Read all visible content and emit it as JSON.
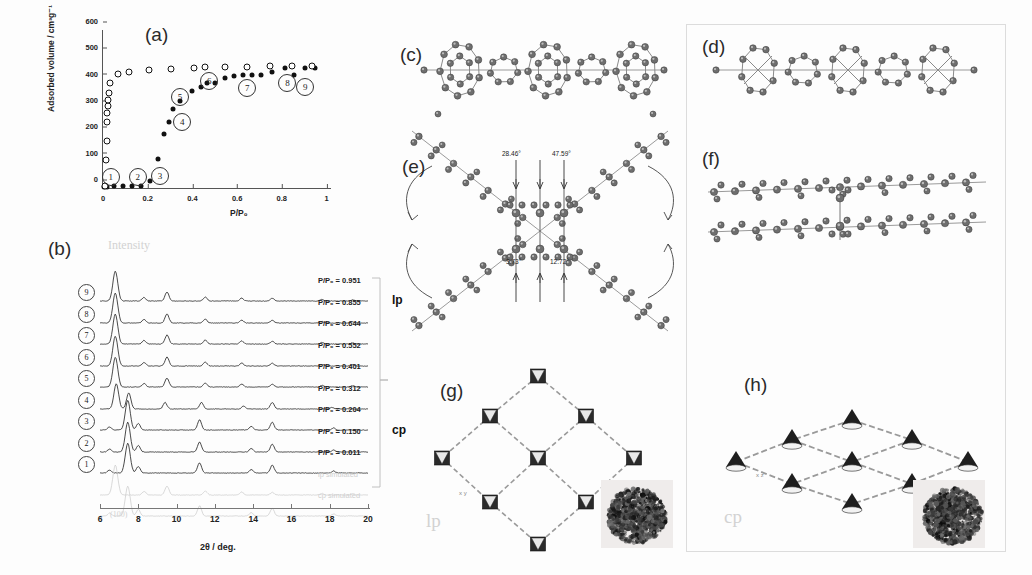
{
  "figure": {
    "panels": [
      "a",
      "b",
      "c",
      "d",
      "e",
      "f",
      "g",
      "h"
    ]
  },
  "panel_a": {
    "label": "(a)",
    "ylabel": "Adsorbed volume / cm³g⁻¹",
    "xlabel": "P/P₀",
    "yticks": [
      "0",
      "100",
      "200",
      "300",
      "400",
      "500",
      "600"
    ],
    "xticks": [
      "0",
      "0.2",
      "0.4",
      "0.6",
      "0.8",
      "1"
    ],
    "markers": [
      "1",
      "2",
      "3",
      "4",
      "5",
      "6",
      "7",
      "8",
      "9"
    ]
  },
  "chart_data": {
    "type": "scatter",
    "xlabel": "P/P₀",
    "ylabel": "Adsorbed volume / cm³g⁻¹",
    "xlim": [
      0,
      1.02
    ],
    "ylim": [
      0,
      600
    ],
    "xticks": [
      0,
      0.2,
      0.4,
      0.6,
      0.8,
      1
    ],
    "yticks": [
      0,
      100,
      200,
      300,
      400,
      500,
      600
    ],
    "grid": false,
    "legend": "none",
    "series": [
      {
        "name": "adsorption",
        "marker": "filled-circle",
        "points": [
          [
            0.005,
            5
          ],
          [
            0.02,
            5
          ],
          [
            0.05,
            8
          ],
          [
            0.09,
            8
          ],
          [
            0.13,
            8
          ],
          [
            0.17,
            8
          ],
          [
            0.21,
            25
          ],
          [
            0.245,
            110
          ],
          [
            0.275,
            205
          ],
          [
            0.295,
            250
          ],
          [
            0.315,
            300
          ],
          [
            0.345,
            330
          ],
          [
            0.4,
            370
          ],
          [
            0.44,
            385
          ],
          [
            0.465,
            400
          ],
          [
            0.5,
            400
          ],
          [
            0.545,
            418
          ],
          [
            0.585,
            425
          ],
          [
            0.625,
            428
          ],
          [
            0.665,
            428
          ],
          [
            0.705,
            430
          ],
          [
            0.755,
            440
          ],
          [
            0.815,
            455
          ],
          [
            0.855,
            430
          ],
          [
            0.905,
            455
          ],
          [
            0.95,
            455
          ]
        ]
      },
      {
        "name": "desorption",
        "marker": "open-circle",
        "points": [
          [
            0.008,
            8
          ],
          [
            0.012,
            105
          ],
          [
            0.016,
            180
          ],
          [
            0.018,
            250
          ],
          [
            0.02,
            285
          ],
          [
            0.022,
            310
          ],
          [
            0.024,
            335
          ],
          [
            0.026,
            360
          ],
          [
            0.03,
            400
          ],
          [
            0.065,
            432
          ],
          [
            0.115,
            440
          ],
          [
            0.205,
            448
          ],
          [
            0.305,
            452
          ],
          [
            0.405,
            455
          ],
          [
            0.455,
            458
          ],
          [
            0.545,
            458
          ],
          [
            0.645,
            460
          ],
          [
            0.745,
            462
          ],
          [
            0.845,
            462
          ],
          [
            0.935,
            465
          ]
        ]
      }
    ],
    "annotations": [
      {
        "label": "1",
        "x": 0.035,
        "y": 40
      },
      {
        "label": "2",
        "x": 0.155,
        "y": 42
      },
      {
        "label": "3",
        "x": 0.255,
        "y": 45
      },
      {
        "label": "4",
        "x": 0.355,
        "y": 250
      },
      {
        "label": "5",
        "x": 0.345,
        "y": 345
      },
      {
        "label": "6",
        "x": 0.475,
        "y": 405
      },
      {
        "label": "7",
        "x": 0.645,
        "y": 380
      },
      {
        "label": "8",
        "x": 0.825,
        "y": 400
      },
      {
        "label": "9",
        "x": 0.905,
        "y": 385
      }
    ]
  },
  "panel_b": {
    "label": "(b)",
    "xlabel": "2θ / deg.",
    "xticks": [
      "6",
      "8",
      "10",
      "12",
      "14",
      "16",
      "18",
      "20"
    ],
    "group_labels": {
      "top": "lp",
      "bottom": "cp"
    },
    "miller_index": "(100)",
    "traces": [
      {
        "num": "9",
        "pp": "P/P₀ = 0.951"
      },
      {
        "num": "8",
        "pp": "P/P₀ = 0.855"
      },
      {
        "num": "7",
        "pp": "P/P₀ = 0.644"
      },
      {
        "num": "6",
        "pp": "P/P₀ = 0.552"
      },
      {
        "num": "5",
        "pp": "P/P₀ = 0.401"
      },
      {
        "num": "4",
        "pp": "P/P₀ = 0.312"
      },
      {
        "num": "3",
        "pp": "P/P₀ = 0.204"
      },
      {
        "num": "2",
        "pp": "P/P₀ = 0.150"
      },
      {
        "num": "1",
        "pp": "P/P₀ = 0.011"
      },
      {
        "num": "",
        "pp": "lp simulated"
      },
      {
        "num": "",
        "pp": "cp simulated"
      }
    ]
  },
  "panel_c": {
    "label": "(c)"
  },
  "panel_d": {
    "label": "(d)"
  },
  "panel_e": {
    "label": "(e)",
    "angles": [
      "28.46°",
      "47.59°",
      "3.73°",
      "12.72°"
    ]
  },
  "panel_f": {
    "label": "(f)"
  },
  "panel_g": {
    "label": "(g)",
    "phase": "lp",
    "axes": "x y"
  },
  "panel_h": {
    "label": "(h)",
    "phase": "cp",
    "axes": "x z"
  }
}
